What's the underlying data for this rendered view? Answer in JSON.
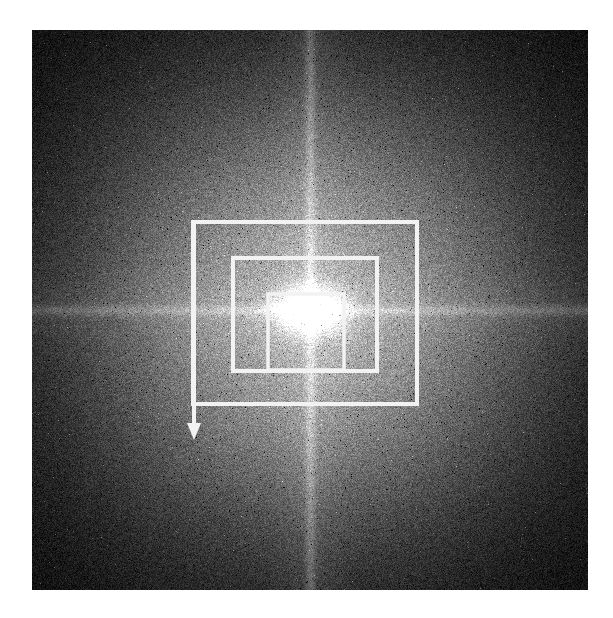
{
  "figure": {
    "kind": "fft-magnitude-spectrum",
    "background_color": "#ffffff",
    "panel": {
      "x": 32,
      "y": 30,
      "width": 556,
      "height": 560,
      "center_x": 310,
      "center_y": 310,
      "corner_color": "#0b0b0b",
      "mid_color": "#6a6a6a",
      "core_color": "#ffffff"
    },
    "spikes": [
      {
        "name": "vertical-spectral-spike",
        "orientation": "vertical",
        "position_x": 310,
        "color": "#e8e8e8"
      },
      {
        "name": "horizontal-spectral-spike",
        "orientation": "horizontal",
        "position_y": 310,
        "color": "#d8d8d8"
      }
    ],
    "dc_peak": {
      "name": "dc-peak",
      "center_x": 305,
      "center_y": 313,
      "color": "#ffffff"
    }
  },
  "overlays": {
    "stroke_color": "#f2f2f2",
    "stroke_width": 4,
    "boxes": [
      {
        "name": "outer-roi-box",
        "label": "outer region of interest",
        "x": 193,
        "y": 222,
        "width": 224,
        "height": 182
      },
      {
        "name": "middle-roi-box",
        "label": "middle region of interest",
        "x": 233,
        "y": 258,
        "width": 144,
        "height": 113
      },
      {
        "name": "inner-roi-box",
        "label": "inner region of interest",
        "x": 268,
        "y": 294,
        "width": 76,
        "height": 76
      }
    ],
    "arrow": {
      "name": "down-arrow-annotation",
      "start_x": 194,
      "start_y": 222,
      "end_x": 194,
      "end_y": 440,
      "head_width": 14,
      "head_length": 17,
      "direction": "down",
      "color": "#f2f2f2"
    }
  }
}
